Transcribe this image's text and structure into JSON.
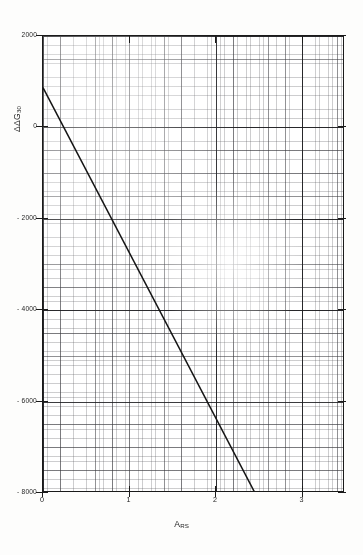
{
  "chart_data": {
    "type": "line",
    "title": "",
    "subtitle": "",
    "xlabel_main": "A",
    "xlabel_sub": "RS",
    "ylabel_main": "ΔΔG",
    "ylabel_sub": "30",
    "xlim": [
      0,
      3.49
    ],
    "ylim": [
      -8000,
      2000
    ],
    "xticks": [
      0,
      1,
      2,
      3
    ],
    "xtick_labels": [
      "0",
      "1",
      "2",
      "3"
    ],
    "yticks": [
      2000,
      0,
      -2000,
      -4000,
      -6000,
      -8000
    ],
    "ytick_labels": [
      "2000",
      "0",
      "- 2000",
      "- 4000",
      "- 6000",
      "- 8000"
    ],
    "grid": true,
    "grid_style": "graph-paper",
    "legend": null,
    "series": [
      {
        "name": "regression-line",
        "style": "solid",
        "color": "#141414",
        "x": [
          0.0,
          2.45
        ],
        "y": [
          870,
          -8000
        ]
      }
    ],
    "annotations": []
  },
  "axis_colors": {
    "frame": "#1a1a1a",
    "grid_minor": "#5a5a5f",
    "grid_major": "#19191c",
    "line": "#141414",
    "background": "#ffffff",
    "page": "#fdfdfc"
  }
}
